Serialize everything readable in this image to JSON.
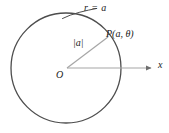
{
  "figure": {
    "background_color": "#ffffff",
    "labels": {
      "circle_equation": "r = a",
      "point_p": "P(a, θ)",
      "radius_magnitude": "|a|",
      "origin": "O",
      "x_axis": "x"
    },
    "geometry": {
      "circle": {
        "center_x": 66,
        "center_y": 68,
        "radius": 55,
        "stroke_color": "#4d4d4d",
        "stroke_width": 1.2,
        "fill": "none"
      },
      "origin_point": {
        "x": 67,
        "y": 68
      },
      "point_p": {
        "x": 108,
        "y": 37
      },
      "radius_line": {
        "from_x": 67,
        "from_y": 68,
        "to_x": 108,
        "to_y": 37,
        "stroke_color": "#a6a6a6",
        "stroke_width": 1.1
      },
      "x_axis": {
        "from_x": 67,
        "from_y": 68,
        "to_x": 153,
        "to_y": 68,
        "stroke_color": "#a6a6a6",
        "stroke_width": 1.1,
        "arrowhead": true
      },
      "leader_line": {
        "from_x": 62,
        "from_y": 17,
        "to_x": 96,
        "to_y": 8,
        "stroke_color": "#4d4d4d",
        "stroke_width": 1.0
      }
    }
  }
}
